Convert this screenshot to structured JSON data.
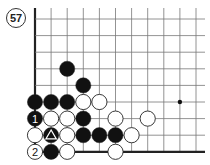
{
  "problem": {
    "number": "57"
  },
  "board": {
    "origin_x": 35,
    "origin_y": 19,
    "spacing_x": 16.1,
    "spacing_y": 16.6,
    "cols": 11,
    "rows": 9,
    "top_extend": 11,
    "right_extend": 9,
    "line_color": "#777777",
    "edge_color": "#222222",
    "edges": [
      "left",
      "bottom"
    ],
    "star_points": [
      {
        "col": 9,
        "row": 5
      }
    ],
    "stone_radius": 7.6
  },
  "stones": [
    {
      "color": "black",
      "col": 2,
      "row": 3
    },
    {
      "color": "black",
      "col": 3,
      "row": 4
    },
    {
      "color": "black",
      "col": 0,
      "row": 5
    },
    {
      "color": "black",
      "col": 1,
      "row": 5
    },
    {
      "color": "black",
      "col": 2,
      "row": 5
    },
    {
      "color": "white",
      "col": 3,
      "row": 5
    },
    {
      "color": "white",
      "col": 4,
      "row": 5
    },
    {
      "color": "black",
      "col": 0,
      "row": 6,
      "label": "1"
    },
    {
      "color": "white",
      "col": 1,
      "row": 6
    },
    {
      "color": "white",
      "col": 2,
      "row": 6
    },
    {
      "color": "black",
      "col": 3,
      "row": 6
    },
    {
      "color": "white",
      "col": 5,
      "row": 6
    },
    {
      "color": "white",
      "col": 7,
      "row": 6
    },
    {
      "color": "white",
      "col": 0,
      "row": 7
    },
    {
      "color": "black",
      "col": 1,
      "row": 7,
      "mark": "triangle"
    },
    {
      "color": "white",
      "col": 2,
      "row": 7
    },
    {
      "color": "black",
      "col": 3,
      "row": 7
    },
    {
      "color": "black",
      "col": 4,
      "row": 7
    },
    {
      "color": "black",
      "col": 5,
      "row": 7
    },
    {
      "color": "white",
      "col": 6,
      "row": 7
    },
    {
      "color": "white",
      "col": 0,
      "row": 8,
      "label": "2"
    },
    {
      "color": "black",
      "col": 1,
      "row": 8
    },
    {
      "color": "white",
      "col": 2,
      "row": 8
    },
    {
      "color": "white",
      "col": 5,
      "row": 8
    }
  ]
}
